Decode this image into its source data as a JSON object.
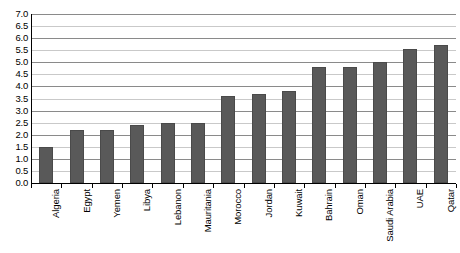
{
  "chart_data": {
    "type": "bar",
    "title": "",
    "subtitle": "",
    "xlabel": "",
    "ylabel": "",
    "ylim": [
      0.0,
      7.0
    ],
    "ytick_step": 0.5,
    "grid": true,
    "legend": null,
    "orientation": "vertical",
    "bar_color": "#595959",
    "categories": [
      "Algeria",
      "Egypt",
      "Yemen",
      "Libya",
      "Lebanon",
      "Mauritania",
      "Morocco",
      "Jordan",
      "Kuwait",
      "Bahrain",
      "Oman",
      "Saudi Arabia",
      "UAE",
      "Qatar"
    ],
    "values": [
      1.5,
      2.2,
      2.2,
      2.4,
      2.5,
      2.5,
      3.6,
      3.7,
      3.8,
      4.8,
      4.8,
      5.0,
      5.55,
      5.7
    ],
    "ytick_labels": [
      "7.0",
      "6.5",
      "6.0",
      "5.5",
      "5.0",
      "4.5",
      "4.0",
      "3.5",
      "3.0",
      "2.5",
      "2.0",
      "1.5",
      "1.0",
      "0.5",
      "0.0"
    ],
    "ytick_values": [
      7.0,
      6.5,
      6.0,
      5.5,
      5.0,
      4.5,
      4.0,
      3.5,
      3.0,
      2.5,
      2.0,
      1.5,
      1.0,
      0.5,
      0.0
    ]
  }
}
